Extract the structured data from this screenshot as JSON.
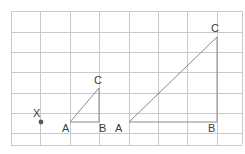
{
  "figure": {
    "width": 245,
    "height": 154,
    "background_color": "#ffffff"
  },
  "colors": {
    "grid_line": "#c9c9c9",
    "triangle_stroke": "#8a8a8a",
    "triangle_fill": "none",
    "label_text": "#3c3c3c",
    "point_marker": "#595959"
  },
  "grid": {
    "x_lines": [
      11,
      40,
      70,
      99,
      129,
      158,
      187,
      217,
      242
    ],
    "y_lines": [
      11,
      32,
      52,
      72,
      93,
      113,
      133,
      145
    ],
    "columns": 8,
    "rows": 7,
    "cell_width": 29.5,
    "cell_height": 20.3
  },
  "points": [
    {
      "name": "X",
      "label": "X",
      "marker_x": 41,
      "marker_y": 122,
      "marker_radius": 2.4,
      "label_x": 33,
      "label_y": 117
    }
  ],
  "triangles": [
    {
      "name": "small-triangle",
      "vertices": [
        {
          "label": "A",
          "x": 70,
          "y": 122,
          "label_x": 62,
          "label_y": 132
        },
        {
          "label": "B",
          "x": 99,
          "y": 122,
          "label_x": 99,
          "label_y": 132
        },
        {
          "label": "C",
          "x": 99,
          "y": 88,
          "label_x": 94,
          "label_y": 84
        }
      ],
      "path": "M 70 122 L 99 122 L 99 88 Z",
      "base_length_cells": 1,
      "height_cells": 1.7
    },
    {
      "name": "large-triangle",
      "vertices": [
        {
          "label": "A",
          "x": 129,
          "y": 122,
          "label_x": 115,
          "label_y": 132
        },
        {
          "label": "B",
          "x": 217,
          "y": 122,
          "label_x": 208,
          "label_y": 132
        },
        {
          "label": "C",
          "x": 217,
          "y": 37,
          "label_x": 211,
          "label_y": 32
        }
      ],
      "path": "M 129 122 L 217 122 L 217 37 Z",
      "base_length_cells": 3,
      "height_cells": 4.2
    }
  ]
}
